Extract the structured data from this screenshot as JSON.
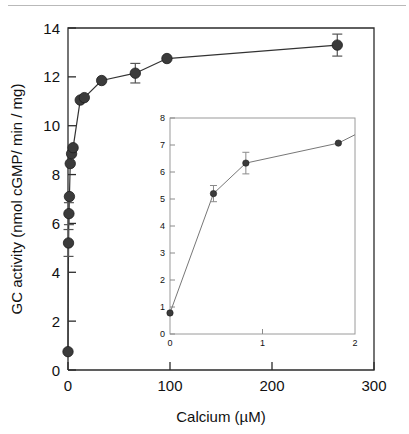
{
  "figure": {
    "background_color": "#ffffff",
    "top_rule_color": "#b9b9b9"
  },
  "chart_data": {
    "type": "line",
    "title": "",
    "xlabel": "Calcium (µM)",
    "ylabel": "GC activity (nmol cGMP/ min / mg)",
    "xlim": [
      0,
      300
    ],
    "ylim": [
      0,
      14
    ],
    "xticks": [
      0,
      100,
      200,
      300
    ],
    "xticklabels": [
      "0",
      "100",
      "200",
      "300"
    ],
    "yticks": [
      0,
      2,
      4,
      6,
      8,
      10,
      12,
      14
    ],
    "yticklabels": [
      "0",
      "2",
      "4",
      "6",
      "8",
      "10",
      "12",
      "14"
    ],
    "grid": false,
    "legend": "none",
    "marker": "filled-circle",
    "marker_color": "#3b3b3b",
    "line_color": "#333333",
    "series": [
      {
        "name": "GC activity vs Calcium",
        "x": [
          0.0,
          0.5,
          0.9,
          1.4,
          2.2,
          3.5,
          5.0,
          12.0,
          16.0,
          33.0,
          66.0,
          97.0,
          264.0
        ],
        "y": [
          0.75,
          5.2,
          6.4,
          7.1,
          8.45,
          8.85,
          9.1,
          11.05,
          11.15,
          11.85,
          12.15,
          12.75,
          13.3
        ],
        "yerr": [
          0.0,
          0.55,
          0.45,
          0.0,
          0.0,
          0.0,
          0.0,
          0.0,
          0.0,
          0.0,
          0.4,
          0.0,
          0.45
        ]
      }
    ]
  },
  "inset_chart_data": {
    "type": "line",
    "title": "",
    "xlabel": "",
    "ylabel": "",
    "xlim": [
      0,
      2
    ],
    "ylim": [
      0,
      8
    ],
    "xticks": [
      0,
      1,
      2
    ],
    "xticklabels": [
      "0",
      "1",
      "2"
    ],
    "yticks": [
      0,
      1,
      2,
      3,
      4,
      5,
      6,
      7,
      8
    ],
    "yticklabels": [
      "0",
      "1",
      "2",
      "3",
      "4",
      "5",
      "6",
      "7",
      "8"
    ],
    "grid": false,
    "legend": "none",
    "marker": "filled-circle",
    "marker_color": "#3b3b3b",
    "line_color": "#777777",
    "series": [
      {
        "name": "GC activity vs Calcium (low range)",
        "x": [
          0.0,
          0.47,
          0.82,
          1.82
        ],
        "y": [
          0.78,
          5.2,
          6.33,
          7.07
        ],
        "yerr": [
          0.0,
          0.3,
          0.4,
          0.0
        ]
      }
    ]
  }
}
